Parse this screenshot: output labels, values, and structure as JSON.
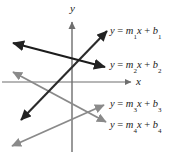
{
  "figure": {
    "background_color": "#ffffff",
    "axes": {
      "x_label": "x",
      "y_label": "y",
      "axis_color": "#6e6e6e",
      "origin": {
        "x": 72,
        "y": 82
      },
      "x_axis": {
        "x1": 2,
        "y1": 82,
        "x2": 133,
        "y2": 82,
        "arrow": "right"
      },
      "y_axis": {
        "x1": 72,
        "y1": 20,
        "x2": 72,
        "y2": 152,
        "arrow": "up"
      }
    },
    "lines": [
      {
        "id": "m1",
        "label": "y = m₁x + b₁",
        "label_parts": {
          "y": "y",
          "eq": "=",
          "m": "m",
          "msub": "1",
          "x": "x",
          "plus": "+",
          "b": "b",
          "bsub": "1"
        },
        "color": "#2b2b2b",
        "stroke_width": 2.1,
        "slope_sign": "positive",
        "arrow_ends": "both",
        "x1": 21,
        "y1": 120,
        "x2": 107,
        "y2": 31
      },
      {
        "id": "m2",
        "label": "y = m₂x + b₂",
        "label_parts": {
          "y": "y",
          "eq": "=",
          "m": "m",
          "msub": "2",
          "x": "x",
          "plus": "+",
          "b": "b",
          "bsub": "2"
        },
        "color": "#1c1c1c",
        "stroke_width": 2.3,
        "slope_sign": "negative",
        "arrow_ends": "both",
        "x1": 13,
        "y1": 43,
        "x2": 105,
        "y2": 67
      },
      {
        "id": "m3",
        "label": "y = m₃x + b₃",
        "label_parts": {
          "y": "y",
          "eq": "=",
          "m": "m",
          "msub": "3",
          "x": "x",
          "plus": "+",
          "b": "b",
          "bsub": "3"
        },
        "color": "#8a8a8a",
        "stroke_width": 1.9,
        "slope_sign": "positive",
        "arrow_ends": "both",
        "x1": 12,
        "y1": 146,
        "x2": 104,
        "y2": 105
      },
      {
        "id": "m4",
        "label": "y = m₄x + b₄",
        "label_parts": {
          "y": "y",
          "eq": "=",
          "m": "m",
          "msub": "4",
          "x": "x",
          "plus": "+",
          "b": "b",
          "bsub": "4"
        },
        "color": "#8a8a8a",
        "stroke_width": 1.9,
        "slope_sign": "negative",
        "arrow_ends": "both",
        "x1": 13,
        "y1": 72,
        "x2": 106,
        "y2": 122
      }
    ]
  }
}
